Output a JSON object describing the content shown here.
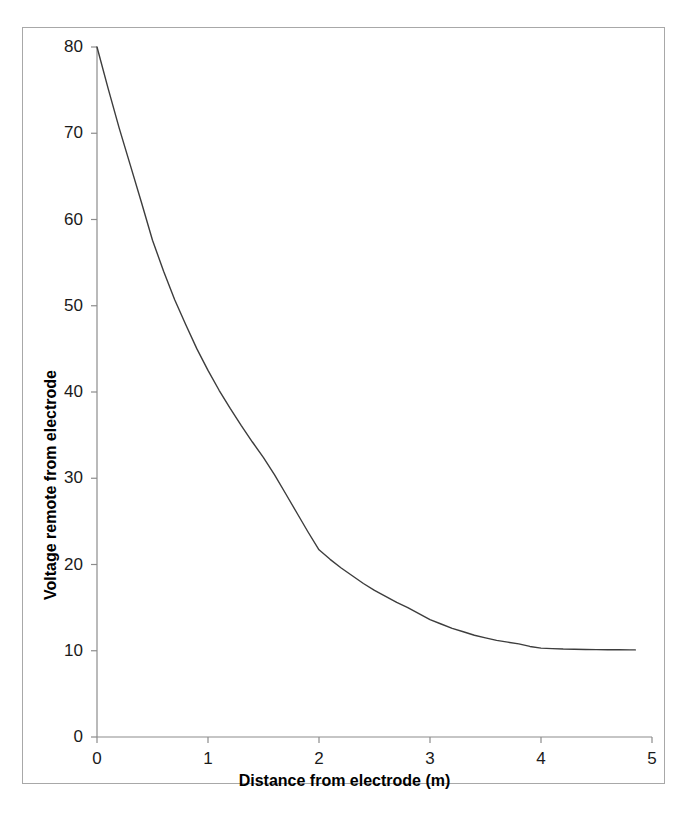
{
  "chart_data": {
    "type": "line",
    "title": "",
    "subtitle": "",
    "xlabel": "Distance from electrode (m)",
    "ylabel": "Voltage remote from electrode",
    "xlim": [
      0,
      5
    ],
    "ylim": [
      0,
      80
    ],
    "xticks": [
      "0",
      "1",
      "2",
      "3",
      "4",
      "5"
    ],
    "xtick_values": [
      0,
      1,
      2,
      3,
      4,
      5
    ],
    "yticks": [
      "0",
      "10",
      "20",
      "30",
      "40",
      "50",
      "60",
      "70",
      "80"
    ],
    "ytick_values": [
      0,
      10,
      20,
      30,
      40,
      50,
      60,
      70,
      80
    ],
    "grid": false,
    "legend": null,
    "annotations": [],
    "line_color": "#3d3d3d",
    "line_width": 1.4,
    "series": [
      {
        "name": "Voltage vs distance",
        "x": [
          0.0,
          0.1,
          0.2,
          0.3,
          0.4,
          0.5,
          0.6,
          0.7,
          0.8,
          0.9,
          1.0,
          1.1,
          1.2,
          1.3,
          1.4,
          1.5,
          1.6,
          1.7,
          1.8,
          1.9,
          2.0,
          2.1,
          2.2,
          2.3,
          2.4,
          2.5,
          2.6,
          2.7,
          2.8,
          2.9,
          3.0,
          3.1,
          3.2,
          3.3,
          3.4,
          3.5,
          3.6,
          3.7,
          3.8,
          3.9,
          4.0,
          4.1,
          4.2,
          4.3,
          4.4,
          4.5,
          4.6,
          4.7,
          4.8,
          4.85
        ],
        "y": [
          80.0,
          75.2,
          70.6,
          66.3,
          62.0,
          57.6,
          54.0,
          50.7,
          47.8,
          45.0,
          42.5,
          40.2,
          38.1,
          36.1,
          34.2,
          32.4,
          30.4,
          28.2,
          26.0,
          23.8,
          21.7,
          20.6,
          19.6,
          18.7,
          17.8,
          17.0,
          16.3,
          15.6,
          15.0,
          14.3,
          13.6,
          13.1,
          12.6,
          12.2,
          11.8,
          11.5,
          11.2,
          11.0,
          10.8,
          10.5,
          10.3,
          10.25,
          10.2,
          10.18,
          10.15,
          10.13,
          10.12,
          10.11,
          10.1,
          10.1
        ]
      }
    ]
  },
  "axes": {
    "x_title": "Distance from electrode (m)",
    "y_title": "Voltage remote from electrode"
  }
}
